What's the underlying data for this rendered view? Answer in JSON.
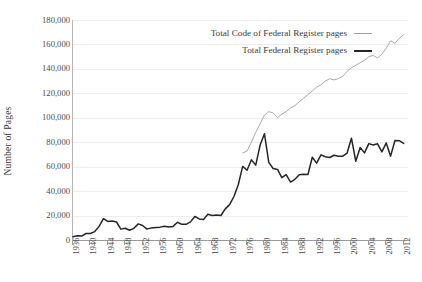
{
  "chart_data": {
    "type": "line",
    "title": "",
    "xlabel": "",
    "ylabel": "Number of Pages",
    "ylim": [
      0,
      180000
    ],
    "xlim": [
      1936,
      2013
    ],
    "grid": true,
    "legend_position": "top-center",
    "y_ticks": [
      "0",
      "20,000",
      "40,000",
      "60,000",
      "80,000",
      "100,000",
      "120,000",
      "140,000",
      "160,000",
      "180,000"
    ],
    "y_tick_values": [
      0,
      20000,
      40000,
      60000,
      80000,
      100000,
      120000,
      140000,
      160000,
      180000
    ],
    "x_ticks": [
      "1936",
      "1940",
      "1944",
      "1948",
      "1952",
      "1956",
      "1960",
      "1964",
      "1968",
      "1972",
      "1976",
      "1980",
      "1984",
      "1988",
      "1992",
      "1996",
      "2000",
      "2004",
      "2008",
      "2012"
    ],
    "x_tick_values": [
      1936,
      1940,
      1944,
      1948,
      1952,
      1956,
      1960,
      1964,
      1968,
      1972,
      1976,
      1980,
      1984,
      1988,
      1992,
      1996,
      2000,
      2004,
      2008,
      2012
    ],
    "colors": {
      "federal_register": "#262626",
      "code_of_federal_regulations": "#a0a0a0",
      "gridline": "#ededed",
      "axis": "#9a9a9a"
    },
    "series": [
      {
        "name": "Total Code of Federal Register pages",
        "color": "#a0a0a0",
        "x": [
          1975,
          1976,
          1977,
          1978,
          1979,
          1980,
          1981,
          1982,
          1983,
          1984,
          1985,
          1986,
          1987,
          1988,
          1989,
          1990,
          1991,
          1992,
          1993,
          1994,
          1995,
          1996,
          1997,
          1998,
          1999,
          2000,
          2001,
          2002,
          2003,
          2004,
          2005,
          2006,
          2007,
          2008,
          2009,
          2010,
          2011,
          2012
        ],
        "values": [
          71224,
          72736,
          80000,
          88000,
          95000,
          102195,
          105000,
          104000,
          100000,
          103000,
          105000,
          108000,
          110000,
          113000,
          116000,
          119000,
          122000,
          125000,
          127000,
          130000,
          132000,
          131000,
          132000,
          134000,
          138000,
          141000,
          143000,
          145000,
          147000,
          150000,
          151000,
          149000,
          152000,
          157000,
          163000,
          161000,
          165000,
          168000
        ]
      },
      {
        "name": "Total Federal Register pages",
        "color": "#262626",
        "x": [
          1936,
          1937,
          1938,
          1939,
          1940,
          1941,
          1942,
          1943,
          1944,
          1945,
          1946,
          1947,
          1948,
          1949,
          1950,
          1951,
          1952,
          1953,
          1954,
          1955,
          1956,
          1957,
          1958,
          1959,
          1960,
          1961,
          1962,
          1963,
          1964,
          1965,
          1966,
          1967,
          1968,
          1969,
          1970,
          1971,
          1972,
          1973,
          1974,
          1975,
          1976,
          1977,
          1978,
          1979,
          1980,
          1981,
          1982,
          1983,
          1984,
          1985,
          1986,
          1987,
          1988,
          1989,
          1990,
          1991,
          1992,
          1993,
          1994,
          1995,
          1996,
          1997,
          1998,
          1999,
          2000,
          2001,
          2002,
          2003,
          2004,
          2005,
          2006,
          2007,
          2008,
          2009,
          2010,
          2011,
          2012
        ],
        "values": [
          2620,
          3450,
          3194,
          5307,
          5307,
          6877,
          11134,
          17553,
          15194,
          15508,
          14736,
          8902,
          9608,
          7952,
          9562,
          13175,
          11896,
          8912,
          9910,
          10196,
          10528,
          11156,
          10579,
          11116,
          14479,
          12792,
          12842,
          14842,
          19304,
          17206,
          16850,
          21088,
          20072,
          20464,
          20036,
          25442,
          28924,
          35586,
          45422,
          60221,
          57072,
          65603,
          61261,
          77498,
          87012,
          63554,
          58494,
          57704,
          50998,
          53480,
          47418,
          49654,
          53376,
          53821,
          53620,
          67716,
          62928,
          69688,
          68108,
          67518,
          69368,
          68530,
          68571,
          71161,
          83294,
          64438,
          75606,
          71269,
          78851,
          77752,
          78724,
          72090,
          79435,
          68598,
          81405,
          81247,
          78961
        ]
      }
    ]
  },
  "legend": {
    "items": [
      {
        "label": "Total Code of Federal Register pages",
        "color": "#a0a0a0",
        "width": 1
      },
      {
        "label": "Total Federal Register pages",
        "color": "#262626",
        "width": 2
      }
    ]
  },
  "axes": {
    "y_title": "Number of Pages"
  }
}
